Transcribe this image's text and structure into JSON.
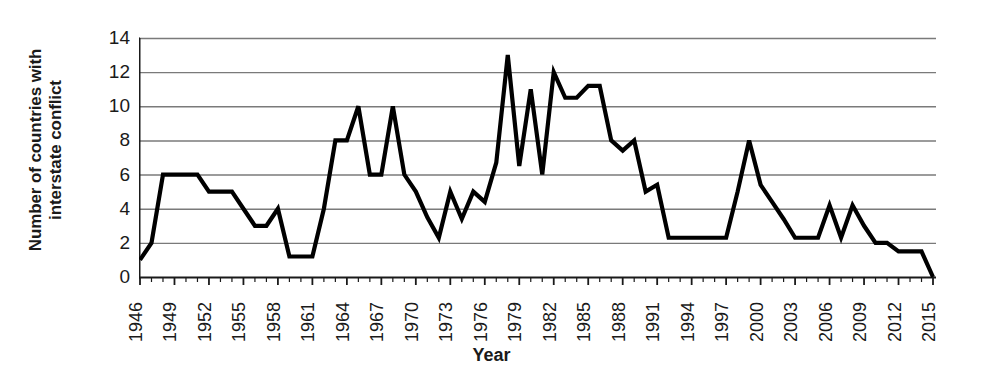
{
  "chart_data": {
    "type": "line",
    "title": "",
    "xlabel": "Year",
    "ylabel": "Number of countries with interstate conflict",
    "ylabel_line1": "Number of countries with",
    "ylabel_line2": "interstate conflict",
    "ylim": [
      0,
      14
    ],
    "ytick_step": 2,
    "yticks": [
      0,
      2,
      4,
      6,
      8,
      10,
      12,
      14
    ],
    "xlim": [
      1946,
      2015
    ],
    "xtick_step": 3,
    "xticks": [
      1946,
      1949,
      1952,
      1955,
      1958,
      1961,
      1964,
      1967,
      1970,
      1973,
      1976,
      1979,
      1982,
      1985,
      1988,
      1991,
      1994,
      1997,
      2000,
      2003,
      2006,
      2009,
      2012,
      2015
    ],
    "grid": "horizontal",
    "legend": "none",
    "line_color": "#000000",
    "grid_color": "#7a7a7a",
    "axis_color": "#1a1a1a",
    "series": [
      {
        "name": "Number of countries with interstate conflict",
        "x": [
          1946,
          1947,
          1948,
          1949,
          1950,
          1951,
          1952,
          1953,
          1954,
          1955,
          1956,
          1957,
          1958,
          1959,
          1960,
          1961,
          1962,
          1963,
          1964,
          1965,
          1966,
          1967,
          1968,
          1969,
          1970,
          1971,
          1972,
          1973,
          1974,
          1975,
          1976,
          1977,
          1978,
          1979,
          1980,
          1981,
          1982,
          1983,
          1984,
          1985,
          1986,
          1987,
          1988,
          1989,
          1990,
          1991,
          1992,
          1993,
          1994,
          1995,
          1996,
          1997,
          1998,
          1999,
          2000,
          2001,
          2002,
          2003,
          2004,
          2005,
          2006,
          2007,
          2008,
          2009,
          2010,
          2011,
          2012,
          2013,
          2014,
          2015
        ],
        "values": [
          1,
          2,
          6,
          6,
          6,
          6,
          5,
          5,
          5,
          4,
          3,
          3,
          4,
          1.2,
          1.2,
          1.2,
          4,
          8,
          8,
          10,
          6,
          6,
          10,
          6,
          5,
          3.5,
          2.3,
          5,
          3.4,
          5,
          4.4,
          6.7,
          13,
          6.5,
          11,
          6,
          12,
          10.5,
          10.5,
          11.2,
          11.2,
          8,
          7.4,
          8,
          5,
          5.4,
          2.3,
          2.3,
          2.3,
          2.3,
          2.3,
          2.3,
          5,
          8,
          5.4,
          4.4,
          3.4,
          2.3,
          2.3,
          2.3,
          4.2,
          2.3,
          4.2,
          3,
          2,
          2,
          1.5,
          1.5,
          1.5,
          0
        ]
      }
    ]
  }
}
